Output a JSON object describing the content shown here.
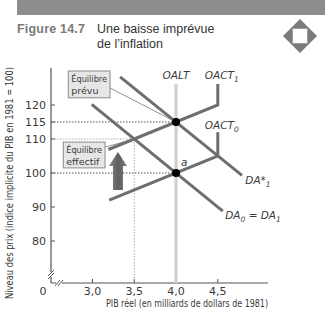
{
  "header": {
    "figure_label": "Figure 14.7",
    "title_line1": "Une baisse imprévue",
    "title_line2": "de l’inflation",
    "icon": "diamond-icon"
  },
  "colors": {
    "curve": "#6e6e6e",
    "long_run_supply": "#cfcfcf",
    "dotted_guide": "#555555",
    "muted_guide": "#aaaaaa",
    "muted_text": "#9a9a9a",
    "point": "#000000",
    "box_fill": "#e6e6e6",
    "box_stroke": "#8a8a8a",
    "arrow": "#6a6a6a"
  },
  "chart_data": {
    "type": "line",
    "title": "Une baisse imprévue de l’inflation",
    "xlabel": "PIB réel (en milliards de dollars de 1981)",
    "ylabel": "Niveau des prix (indice implicite du PIB en 1981 = 100)",
    "xlim": [
      2.5,
      5.1
    ],
    "ylim": [
      67.6,
      131
    ],
    "grid": false,
    "axis_breaks": true,
    "origin_label": "0",
    "x_ticks": [
      {
        "value": 3.0,
        "label": "3,0",
        "muted": false
      },
      {
        "value": 3.5,
        "label": "3,5",
        "muted": true
      },
      {
        "value": 4.0,
        "label": "4,0",
        "muted": false
      },
      {
        "value": 4.5,
        "label": "4,5",
        "muted": false
      }
    ],
    "y_ticks": [
      {
        "value": 120,
        "label": "120",
        "muted": false
      },
      {
        "value": 115,
        "label": "115",
        "muted": false
      },
      {
        "value": 110,
        "label": "110",
        "muted": true
      },
      {
        "value": 100,
        "label": "100",
        "muted": false
      },
      {
        "value": 90,
        "label": "90",
        "muted": false
      },
      {
        "value": 80,
        "label": "80",
        "muted": false
      }
    ],
    "series": [
      {
        "name": "OALT",
        "label": "OALT",
        "sub": "",
        "style": "long_run",
        "points": [
          [
            4.0,
            126.2
          ],
          [
            4.0,
            67.6
          ]
        ],
        "label_at": [
          4.0,
          127.7
        ],
        "anchor": "middle"
      },
      {
        "name": "OACT1",
        "label": "OACT",
        "sub": "1",
        "style": "curve",
        "points": [
          [
            4.5,
            126.2
          ],
          [
            4.5,
            120
          ],
          [
            3.19,
            106.9
          ]
        ],
        "label_at": [
          4.345,
          127.7
        ],
        "anchor": "start"
      },
      {
        "name": "OACT0",
        "label": "OACT",
        "sub": "0",
        "style": "curve",
        "points": [
          [
            4.5,
            112
          ],
          [
            4.5,
            105
          ],
          [
            3.2,
            92
          ]
        ],
        "label_at": [
          4.345,
          113.0
        ],
        "anchor": "start"
      },
      {
        "name": "DA*1",
        "label": "DA*",
        "sub": "1",
        "style": "curve",
        "points": [
          [
            3.33,
            128.3
          ],
          [
            4.79,
            99.3
          ]
        ],
        "label_at": [
          4.83,
          96.8
        ],
        "anchor": "start"
      },
      {
        "name": "DA0 = DA1",
        "label": "DA",
        "sub": "0",
        "label2": " = DA",
        "sub2": "1",
        "style": "curve",
        "points": [
          [
            2.99,
            120.2
          ],
          [
            4.56,
            88.8
          ]
        ],
        "label_at": [
          4.59,
          86.6
        ],
        "anchor": "start"
      }
    ],
    "points": [
      {
        "name": "expected-equilibrium",
        "x": 4.0,
        "y": 115,
        "marker": true,
        "label": ""
      },
      {
        "name": "point-a",
        "x": 4.0,
        "y": 100,
        "marker": true,
        "label": "a",
        "label_at": [
          4.06,
          102.0
        ]
      },
      {
        "name": "actual-equilibrium",
        "x": 3.5,
        "y": 110,
        "marker": false,
        "label": ""
      }
    ],
    "guides": [
      {
        "orient": "h",
        "value": 115,
        "from": 2.49,
        "to": 4.0,
        "muted": false
      },
      {
        "orient": "h",
        "value": 110,
        "from": 2.49,
        "to": 3.5,
        "muted": true
      },
      {
        "orient": "h",
        "value": 100,
        "from": 2.49,
        "to": 4.0,
        "muted": false
      },
      {
        "orient": "v",
        "value": 3.5,
        "from": 110,
        "to": 67.6,
        "muted": true
      }
    ],
    "annotations": [
      {
        "name": "expected-equilibrium-box",
        "line1": "Équilibre",
        "line2": "prévu",
        "box": [
          2.71,
          130.0,
          3.21,
          122.1
        ],
        "leader_from": [
          3.21,
          125.0
        ],
        "leader_to": [
          4.0,
          115
        ]
      },
      {
        "name": "actual-equilibrium-box",
        "line1": "Équilibre",
        "line2": "effectif",
        "box": [
          2.65,
          109.1,
          3.15,
          101.5
        ],
        "leader_from": [
          3.15,
          107.6
        ],
        "leader_to": [
          3.5,
          110
        ]
      }
    ],
    "arrow": {
      "direction": "up",
      "x": 3.305,
      "from": 95.0,
      "to": 106.2
    }
  }
}
